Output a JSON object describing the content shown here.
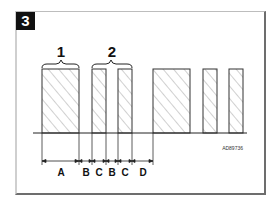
{
  "figure": {
    "number": "3",
    "code": "AD89736"
  },
  "groups": [
    {
      "label": "1",
      "description": "single wide bar"
    },
    {
      "label": "2",
      "description": "pair of narrow bars"
    }
  ],
  "dimensions": {
    "labels": [
      "A",
      "B",
      "C",
      "B",
      "C",
      "D"
    ]
  },
  "colors": {
    "line": "#333333",
    "hatch": "#8a8a8a",
    "badge_bg": "#111111",
    "badge_text": "#ffffff"
  }
}
